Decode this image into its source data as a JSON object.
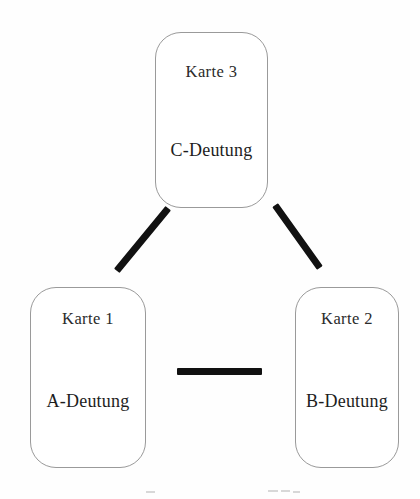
{
  "diagram": {
    "type": "triangle-layout",
    "background_color": "#ffffff",
    "line_color": "#111111",
    "card_border_color": "#9a9a9a",
    "text_color": "#1d1d1d",
    "cards": [
      {
        "id": "card-top",
        "title": "Karte 3",
        "body": "C-Deutung"
      },
      {
        "id": "card-left",
        "title": "Karte 1",
        "body": "A-Deutung"
      },
      {
        "id": "card-right",
        "title": "Karte 2",
        "body": "B-Deutung"
      }
    ],
    "connectors": [
      {
        "id": "connector-left",
        "from": "card-top",
        "to": "card-left",
        "orientation": "diagonal"
      },
      {
        "id": "connector-right",
        "from": "card-top",
        "to": "card-right",
        "orientation": "diagonal"
      },
      {
        "id": "connector-bottom",
        "from": "card-left",
        "to": "card-right",
        "orientation": "horizontal"
      }
    ]
  }
}
